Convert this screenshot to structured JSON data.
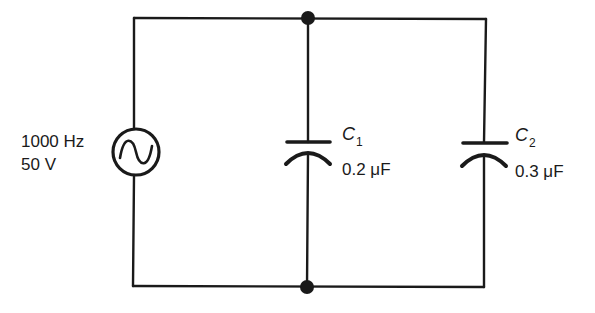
{
  "diagram": {
    "type": "circuit-schematic",
    "source": {
      "frequency_label": "1000 Hz",
      "voltage_label": "50 V",
      "symbol": "ac-sine-source"
    },
    "capacitors": [
      {
        "name": "C",
        "subscript": "1",
        "value_label": "0.2 μF"
      },
      {
        "name": "C",
        "subscript": "2",
        "value_label": "0.3 μF"
      }
    ],
    "nodes": [
      {
        "id": "top-junction"
      },
      {
        "id": "bottom-junction"
      }
    ],
    "colors": {
      "line": "#1a1a1a",
      "background": "#ffffff"
    }
  }
}
